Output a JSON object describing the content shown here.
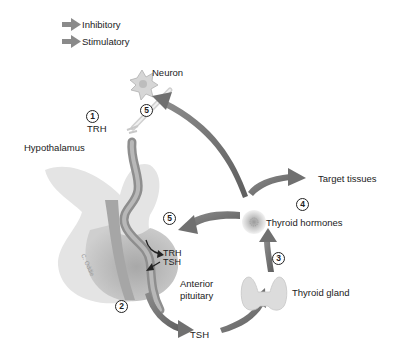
{
  "legend": {
    "items": [
      {
        "label": "Inhibitory",
        "color": "#8a8a8a"
      },
      {
        "label": "Stimulatory",
        "color": "#8a8a8a"
      }
    ]
  },
  "labels": {
    "neuron": "Neuron",
    "trh_top": "TRH",
    "hypothalamus": "Hypothalamus",
    "trh_pituitary": "TRH",
    "tsh_pituitary": "TSH",
    "anterior_pituitary_1": "Anterior",
    "anterior_pituitary_2": "pituitary",
    "tsh_bottom": "TSH",
    "thyroid_gland": "Thyroid gland",
    "thyroid_hormones": "Thyroid hormones",
    "target_tissues": "Target tissues",
    "signature": "C. Oddie"
  },
  "steps": {
    "step1": "1",
    "step2": "2",
    "step3": "3",
    "step4": "4",
    "step5_top": "5",
    "step5_pituitary": "5"
  },
  "colors": {
    "arrow": "#707070",
    "tissue": "#c8c8c8",
    "vessel": "#9a9a9a"
  }
}
